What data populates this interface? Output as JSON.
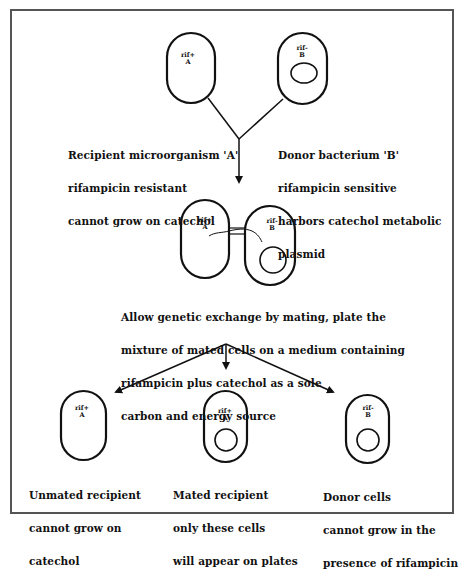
{
  "diagram": {
    "type": "flowchart",
    "title": "",
    "stage1": {
      "recipient": {
        "cell_genotype": "rif+",
        "cell_name": "A",
        "has_plasmid": false,
        "caption_lines": [
          "Recipient microorganism 'A'",
          "rifampicin resistant",
          "cannot grow on catechol"
        ]
      },
      "donor": {
        "cell_genotype": "rif-",
        "cell_name": "B",
        "has_plasmid": true,
        "caption_lines": [
          "Donor bacterium 'B'",
          "rifampicin sensitive",
          "harbors catechol metabolic",
          "plasmid"
        ]
      }
    },
    "stage2": {
      "mating_pair": [
        {
          "cell_genotype": "rif+",
          "cell_name": "A",
          "has_plasmid": false
        },
        {
          "cell_genotype": "rif-",
          "cell_name": "B",
          "has_plasmid": true
        }
      ],
      "caption_lines": [
        "Allow genetic exchange by mating, plate the",
        "mixture of mated cells on a medium containing",
        "rifampicin plus catechol as a sole",
        "carbon and energy source"
      ]
    },
    "stage3": {
      "outcomes": [
        {
          "cell_genotype": "rif+",
          "cell_name": "A",
          "has_plasmid": false,
          "caption_lines": [
            "Unmated recipient",
            "cannot grow on",
            "catechol"
          ]
        },
        {
          "cell_genotype": "rif+",
          "cell_name": "A",
          "has_plasmid": true,
          "caption_lines": [
            "Mated recipient",
            "only these cells",
            "will appear on plates"
          ]
        },
        {
          "cell_genotype": "rif-",
          "cell_name": "B",
          "has_plasmid": true,
          "caption_lines": [
            "Donor cells",
            "cannot grow in the",
            "presence of rifampicin"
          ]
        }
      ]
    },
    "colors": {
      "stroke": "#111111",
      "frame": "#555555",
      "background": "#ffffff"
    }
  }
}
